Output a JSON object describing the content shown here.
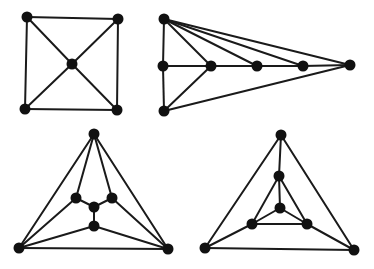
{
  "figure": {
    "colors": {
      "edge": "#1a1a1a",
      "vertex": "#111111",
      "background": "#ffffff"
    }
  },
  "graphs": [
    {
      "id": "graph-square-with-center",
      "vertices": [
        "tl",
        "tr",
        "c",
        "bl",
        "br"
      ],
      "edges": [
        [
          "tl",
          "tr"
        ],
        [
          "tr",
          "br"
        ],
        [
          "br",
          "bl"
        ],
        [
          "bl",
          "tl"
        ],
        [
          "tl",
          "c"
        ],
        [
          "tr",
          "c"
        ],
        [
          "bl",
          "c"
        ],
        [
          "br",
          "c"
        ]
      ]
    },
    {
      "id": "graph-fan",
      "vertices": [
        "top",
        "ml",
        "bot",
        "p1",
        "p2",
        "p3",
        "tip"
      ],
      "edges": [
        [
          "top",
          "ml"
        ],
        [
          "ml",
          "bot"
        ],
        [
          "ml",
          "p1"
        ],
        [
          "p1",
          "p2"
        ],
        [
          "p2",
          "p3"
        ],
        [
          "p3",
          "tip"
        ],
        [
          "top",
          "p1"
        ],
        [
          "top",
          "p2"
        ],
        [
          "top",
          "p3"
        ],
        [
          "top",
          "tip"
        ],
        [
          "bot",
          "p1"
        ],
        [
          "bot",
          "tip"
        ]
      ]
    },
    {
      "id": "graph-triangle-claw",
      "vertices": [
        "top",
        "il",
        "ir",
        "c",
        "lc",
        "bl",
        "br"
      ],
      "edges": [
        [
          "top",
          "bl"
        ],
        [
          "top",
          "br"
        ],
        [
          "bl",
          "br"
        ],
        [
          "top",
          "il"
        ],
        [
          "top",
          "ir"
        ],
        [
          "il",
          "c"
        ],
        [
          "ir",
          "c"
        ],
        [
          "c",
          "lc"
        ],
        [
          "il",
          "bl"
        ],
        [
          "ir",
          "br"
        ],
        [
          "lc",
          "bl"
        ],
        [
          "lc",
          "br"
        ]
      ]
    },
    {
      "id": "graph-nested-triangle",
      "vertices": [
        "top",
        "it",
        "c",
        "il",
        "ir",
        "bl",
        "br"
      ],
      "edges": [
        [
          "top",
          "bl"
        ],
        [
          "top",
          "br"
        ],
        [
          "bl",
          "br"
        ],
        [
          "top",
          "it"
        ],
        [
          "it",
          "il"
        ],
        [
          "it",
          "ir"
        ],
        [
          "it",
          "c"
        ],
        [
          "c",
          "il"
        ],
        [
          "c",
          "ir"
        ],
        [
          "il",
          "ir"
        ],
        [
          "il",
          "bl"
        ],
        [
          "ir",
          "br"
        ]
      ]
    }
  ]
}
